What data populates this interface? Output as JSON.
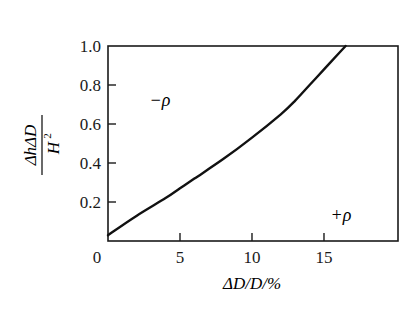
{
  "chart_data": {
    "type": "line",
    "title": "",
    "xlabel": "ΔD/D/%",
    "ylabel": "ΔhΔD / H²",
    "ylabel_parts": {
      "numerator": "ΔhΔD",
      "denominator": "H",
      "denominator_sup": "2"
    },
    "xlim": [
      0,
      20
    ],
    "ylim": [
      0,
      1.0
    ],
    "grid": false,
    "legend": null,
    "x_ticks": [
      0,
      5,
      10,
      15
    ],
    "x_tick_labels": [
      "0",
      "5",
      "10",
      "15"
    ],
    "y_ticks": [
      0.2,
      0.4,
      0.6,
      0.8,
      1.0
    ],
    "y_tick_labels": [
      "0.2",
      "0.4",
      "0.6",
      "0.8",
      "1.0"
    ],
    "series": [
      {
        "name": "boundary",
        "x": [
          0,
          2,
          4,
          5,
          6,
          8,
          10,
          12,
          13,
          14,
          15,
          16,
          16.5
        ],
        "y": [
          0.03,
          0.13,
          0.22,
          0.27,
          0.32,
          0.42,
          0.53,
          0.65,
          0.72,
          0.8,
          0.88,
          0.96,
          1.0
        ]
      }
    ],
    "annotations": [
      {
        "text": "−ρ",
        "x": 3.6,
        "y": 0.72,
        "region": "above curve"
      },
      {
        "text": "+ρ",
        "x": 16.1,
        "y": 0.13,
        "region": "below curve"
      }
    ]
  },
  "labels": {
    "origin": "0",
    "x_axis": "ΔD/D/%",
    "y_num": "ΔhΔD",
    "y_den": "H",
    "y_den_sup": "2",
    "neg_rho": "−ρ",
    "pos_rho": "+ρ"
  }
}
